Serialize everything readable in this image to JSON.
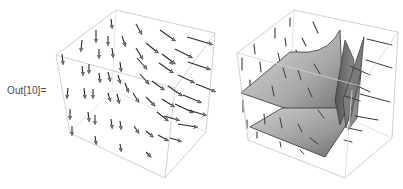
{
  "cell": {
    "output_label": "Out[10]="
  },
  "plots": [
    {
      "name": "vector-field-3d",
      "kind": "VectorPlot3D",
      "box_color": "#c8c8c8",
      "arrow_color": "#2a2a2a",
      "arrow_head_fill": "#8c8c8c"
    },
    {
      "name": "surfaces-with-field-3d",
      "kind": "Show[ContourPlot3D, VectorPlot3D]",
      "box_color": "#c8c8c8",
      "surface_fill_light": "#d4d4d4",
      "surface_fill_dark": "#6e6e6e",
      "field_line_color": "#3a3a3a"
    }
  ]
}
